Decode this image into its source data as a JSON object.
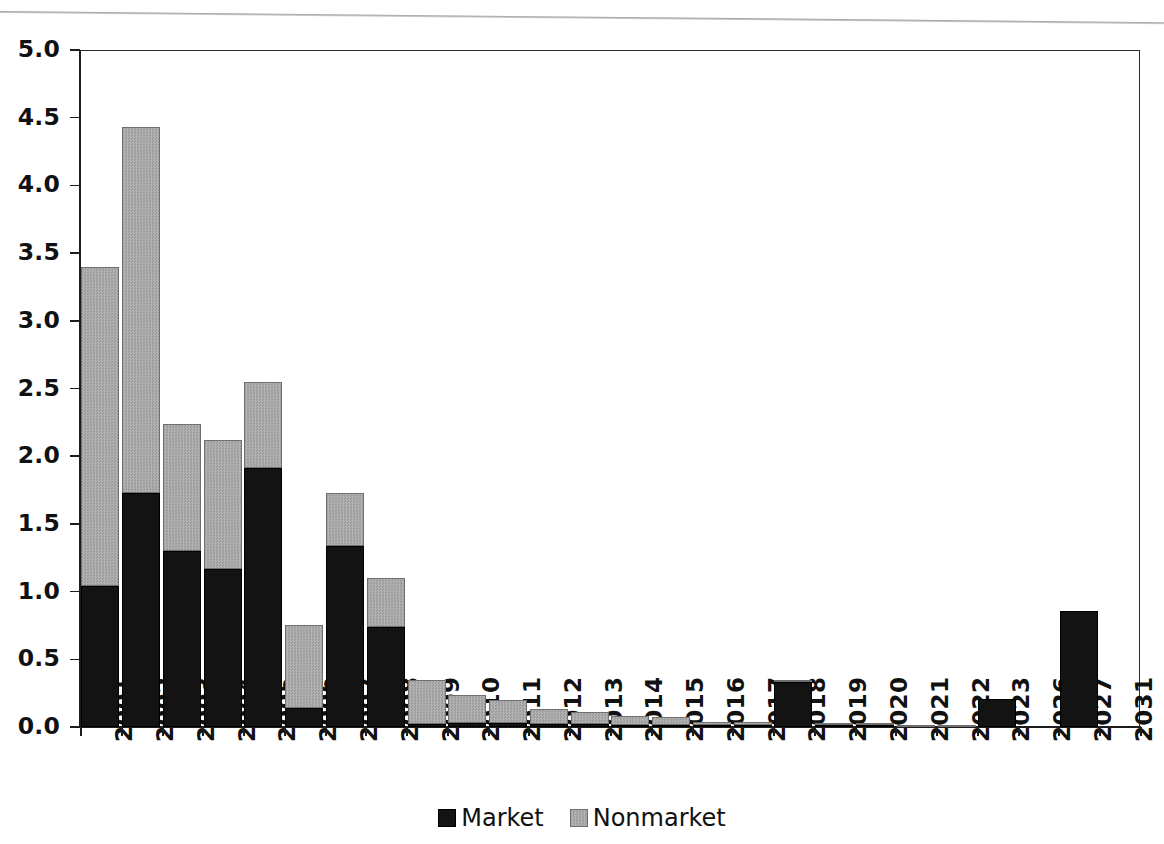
{
  "chart_data": {
    "type": "bar",
    "subtype": "stacked-vertical",
    "title": "",
    "subtitle": "",
    "xlabel": "",
    "ylabel": "",
    "ylim": [
      0.0,
      5.0
    ],
    "ytick_step": 0.5,
    "ytick_labels": [
      "0.0",
      "0.5",
      "1.0",
      "1.5",
      "2.0",
      "2.5",
      "3.0",
      "3.5",
      "4.0",
      "4.5",
      "5.0"
    ],
    "ytick_values": [
      0.0,
      0.5,
      1.0,
      1.5,
      2.0,
      2.5,
      3.0,
      3.5,
      4.0,
      4.5,
      5.0
    ],
    "grid": false,
    "legend_position": "bottom-center",
    "categories": [
      "2001",
      "2002",
      "2003",
      "2004",
      "2005",
      "2006",
      "2007",
      "2008",
      "2009",
      "2010",
      "2011",
      "2012",
      "2013",
      "2014",
      "2015",
      "2016",
      "2017",
      "2018",
      "2019",
      "2020",
      "2021",
      "2022",
      "2023",
      "2026",
      "2027",
      "2031"
    ],
    "series": [
      {
        "name": "Market",
        "color": "#131313",
        "values": [
          1.04,
          1.73,
          1.3,
          1.17,
          1.91,
          0.14,
          1.34,
          0.74,
          0.02,
          0.03,
          0.03,
          0.02,
          0.02,
          0.01,
          0.01,
          0.01,
          0.01,
          0.33,
          0.01,
          0.01,
          0.0,
          0.0,
          0.21,
          0.0,
          0.86,
          0.0
        ]
      },
      {
        "name": "Nonmarket",
        "color": "#a8a8a8",
        "values": [
          2.36,
          2.7,
          0.94,
          0.95,
          0.64,
          0.61,
          0.39,
          0.36,
          0.33,
          0.21,
          0.17,
          0.11,
          0.09,
          0.07,
          0.06,
          0.02,
          0.02,
          0.01,
          0.01,
          0.01,
          0.01,
          0.01,
          0.0,
          0.0,
          0.0,
          0.0
        ]
      }
    ],
    "totals": [
      3.4,
      4.43,
      2.24,
      2.12,
      2.55,
      0.75,
      1.73,
      1.1,
      0.35,
      0.24,
      0.2,
      0.13,
      0.11,
      0.08,
      0.07,
      0.03,
      0.03,
      0.34,
      0.02,
      0.02,
      0.01,
      0.01,
      0.21,
      0.0,
      0.86,
      0.0
    ]
  },
  "legend": {
    "items": [
      {
        "label": "Market",
        "swatch": "market-swatch"
      },
      {
        "label": "Nonmarket",
        "swatch": "nonmarket-swatch"
      }
    ]
  }
}
